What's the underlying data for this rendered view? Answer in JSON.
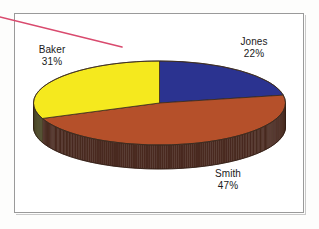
{
  "figure": {
    "background_color": "#ffffff",
    "frame_color": "#9a9a9a"
  },
  "annotation": {
    "name": "diagonal-pen-stroke",
    "color": "#d94a6e",
    "x1": 0,
    "y1": 17,
    "x2": 122,
    "y2": 47,
    "width": 1.6
  },
  "chart_data": {
    "type": "pie",
    "title": "",
    "subtitle": "",
    "xlabel": "",
    "ylabel": "",
    "legend_position": "none",
    "grid": false,
    "three_d": true,
    "labels_show_percent": true,
    "start_angle_deg": 90,
    "direction": "clockwise",
    "categories": [
      "Jones",
      "Smith",
      "Baker"
    ],
    "values": [
      22,
      47,
      31
    ],
    "value_unit": "%",
    "colors": [
      "#2B3390",
      "#B5502A",
      "#F5E91E"
    ],
    "side_colors": [
      "#241E52",
      "#4A2A20",
      "#4C4A28"
    ],
    "slices": [
      {
        "label": "Jones",
        "percent": 22,
        "percent_text": "22%",
        "color": "#2B3390",
        "side_color": "#241E52"
      },
      {
        "label": "Smith",
        "percent": 47,
        "percent_text": "47%",
        "color": "#B5502A",
        "side_color": "#4A2A20"
      },
      {
        "label": "Baker",
        "percent": 31,
        "percent_text": "31%",
        "color": "#F5E91E",
        "side_color": "#4C4A28"
      }
    ]
  },
  "labels": {
    "jones": {
      "name": "Jones",
      "percent": "22%"
    },
    "baker": {
      "name": "Baker",
      "percent": "31%"
    },
    "smith": {
      "name": "Smith",
      "percent": "47%"
    }
  }
}
